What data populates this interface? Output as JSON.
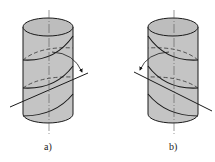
{
  "figure": {
    "colors": {
      "cylinder_fill": "#c4c4c4",
      "top_fill": "#bdbdbd",
      "stroke": "#1a1a1a",
      "axis": "#555555",
      "background": "#ffffff"
    },
    "panels": [
      {
        "id": "a",
        "label": "a)",
        "helix_hand": "right"
      },
      {
        "id": "b",
        "label": "b)",
        "helix_hand": "left"
      }
    ]
  }
}
